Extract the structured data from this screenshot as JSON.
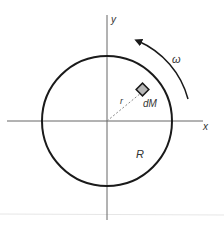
{
  "diagram": {
    "labels": {
      "y_axis": "y",
      "x_axis": "x",
      "radius_element": "r",
      "mass_element": "dM",
      "disk_radius": "R",
      "angular_velocity": "ω"
    },
    "colors": {
      "stroke": "#1a1a1a",
      "axis": "#555555",
      "mass_fill": "#b8b8b8",
      "text": "#333333"
    }
  }
}
